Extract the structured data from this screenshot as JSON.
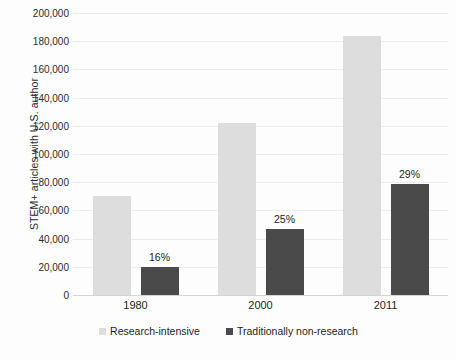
{
  "chart_data": {
    "type": "bar",
    "title": "",
    "subtitle": "",
    "xlabel": "",
    "ylabel": "STEM+ articles with U.S. author",
    "categories": [
      "1980",
      "2000",
      "2011"
    ],
    "ylim": [
      0,
      200000
    ],
    "ytick_step": 20000,
    "ytick_labels": [
      "200,000",
      "180,000",
      "160,000",
      "140,000",
      "120,000",
      "100,000",
      "80,000",
      "60,000",
      "40,000",
      "20,000",
      "0"
    ],
    "ytick_values": [
      200000,
      180000,
      160000,
      140000,
      120000,
      100000,
      80000,
      60000,
      40000,
      20000,
      0
    ],
    "grid": true,
    "legend_position": "bottom",
    "series": [
      {
        "name": "Research-intensive",
        "color": "#dddddd",
        "values": [
          70000,
          122000,
          184000
        ],
        "data_labels": [
          "",
          "",
          ""
        ]
      },
      {
        "name": "Traditionally non-research",
        "color": "#4a4a4a",
        "values": [
          20000,
          47000,
          79000
        ],
        "data_labels": [
          "16%",
          "25%",
          "29%"
        ]
      }
    ]
  },
  "legend": {
    "items": [
      {
        "label": "Research-intensive",
        "swatch": "light-gray-square"
      },
      {
        "label": "Traditionally non-research",
        "swatch": "dark-gray-square"
      }
    ]
  }
}
